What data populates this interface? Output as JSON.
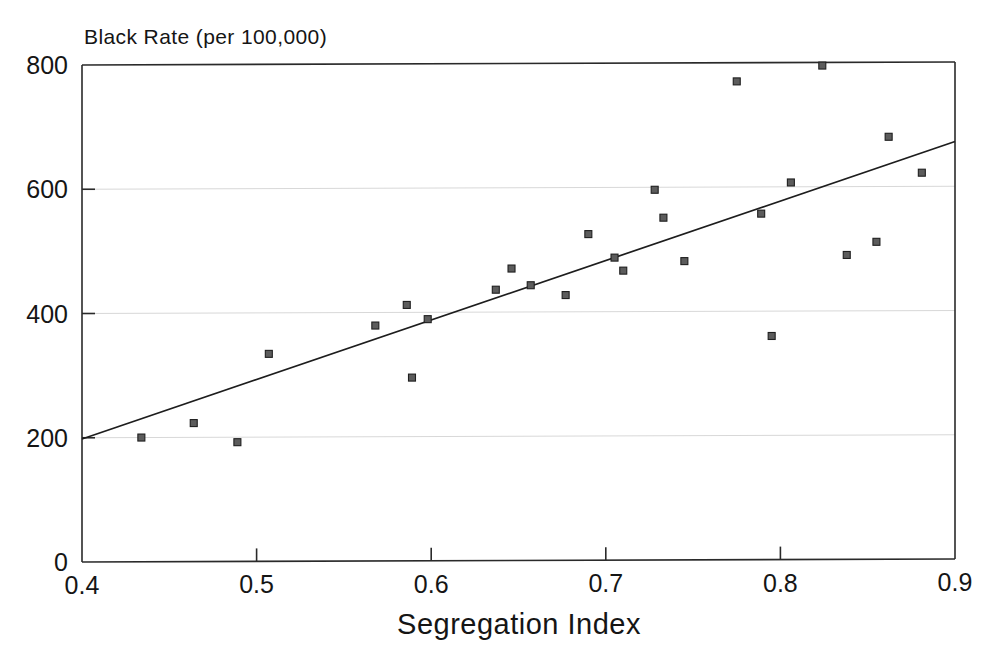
{
  "chart_data": {
    "type": "scatter",
    "title": "",
    "ylabel": "Black Rate (per 100,000)",
    "xlabel": "Segregation Index",
    "xlim": [
      0.4,
      0.9
    ],
    "ylim": [
      0,
      800
    ],
    "xticks": [
      "0.4",
      "0.5",
      "0.6",
      "0.7",
      "0.8",
      "0.9"
    ],
    "xtick_values": [
      0.4,
      0.5,
      0.6,
      0.7,
      0.8,
      0.9
    ],
    "yticks": [
      "0",
      "200",
      "400",
      "600",
      "800"
    ],
    "ytick_values": [
      0,
      200,
      400,
      600,
      800
    ],
    "grid": "faint horizontal gridlines at 200, 400, 600",
    "legend": "none",
    "marker_style": "small filled square",
    "series": [
      {
        "name": "cities",
        "type": "scatter",
        "points": [
          {
            "x": 0.434,
            "y": 200
          },
          {
            "x": 0.464,
            "y": 223
          },
          {
            "x": 0.489,
            "y": 192
          },
          {
            "x": 0.507,
            "y": 334
          },
          {
            "x": 0.568,
            "y": 379
          },
          {
            "x": 0.586,
            "y": 412
          },
          {
            "x": 0.589,
            "y": 295
          },
          {
            "x": 0.598,
            "y": 389
          },
          {
            "x": 0.637,
            "y": 436
          },
          {
            "x": 0.646,
            "y": 470
          },
          {
            "x": 0.657,
            "y": 443
          },
          {
            "x": 0.677,
            "y": 427
          },
          {
            "x": 0.69,
            "y": 525
          },
          {
            "x": 0.705,
            "y": 487
          },
          {
            "x": 0.71,
            "y": 466
          },
          {
            "x": 0.728,
            "y": 596
          },
          {
            "x": 0.733,
            "y": 551
          },
          {
            "x": 0.745,
            "y": 481
          },
          {
            "x": 0.775,
            "y": 770
          },
          {
            "x": 0.789,
            "y": 557
          },
          {
            "x": 0.795,
            "y": 360
          },
          {
            "x": 0.806,
            "y": 607
          },
          {
            "x": 0.824,
            "y": 795
          },
          {
            "x": 0.838,
            "y": 490
          },
          {
            "x": 0.855,
            "y": 511
          },
          {
            "x": 0.862,
            "y": 680
          },
          {
            "x": 0.881,
            "y": 622
          }
        ]
      },
      {
        "name": "regression-line",
        "type": "line",
        "points": [
          {
            "x": 0.4,
            "y": 198
          },
          {
            "x": 0.9,
            "y": 672
          }
        ]
      }
    ]
  },
  "colors": {
    "marker_fill": "#5c5c5c",
    "marker_edge": "#1f1f1f",
    "line": "#1d1d1d",
    "axis": "#2a2a2a",
    "grid": "#d8d8d8",
    "background": "#ffffff",
    "text": "#151515"
  }
}
